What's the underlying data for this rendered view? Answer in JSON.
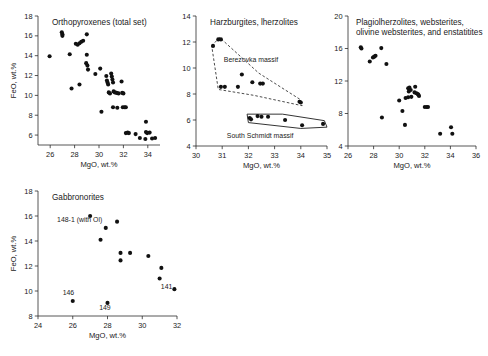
{
  "figure": {
    "background": "#ffffff",
    "marker_color": "#111111",
    "axis_color": "#2b2b2b"
  },
  "chart_data": [
    {
      "type": "scatter",
      "id": "orthopyroxenes",
      "title": "Orthopyroxenes (total set)",
      "xlabel": "MgO, wt.%",
      "ylabel": "FeO, wt.%",
      "xlim": [
        25,
        35
      ],
      "ylim": [
        5,
        18
      ],
      "xticks": [
        26,
        28,
        30,
        32,
        34,
        36
      ],
      "yticks": [
        6,
        8,
        10,
        12,
        14,
        16,
        18
      ],
      "grid": false,
      "legend": "none",
      "points": [
        [
          25.95,
          13.95
        ],
        [
          26.95,
          16.35
        ],
        [
          27.0,
          16.15
        ],
        [
          27.0,
          16.0
        ],
        [
          27.6,
          14.15
        ],
        [
          27.75,
          10.7
        ],
        [
          28.1,
          15.2
        ],
        [
          28.25,
          15.1
        ],
        [
          28.4,
          15.25
        ],
        [
          28.55,
          15.4
        ],
        [
          28.7,
          15.5
        ],
        [
          28.4,
          11.1
        ],
        [
          29.0,
          16.15
        ],
        [
          29.0,
          14.1
        ],
        [
          28.95,
          13.25
        ],
        [
          29.05,
          13.0
        ],
        [
          29.1,
          12.6
        ],
        [
          29.7,
          12.15
        ],
        [
          30.1,
          12.7
        ],
        [
          30.2,
          8.35
        ],
        [
          30.6,
          11.95
        ],
        [
          30.65,
          11.5
        ],
        [
          30.7,
          11.3
        ],
        [
          30.75,
          11.1
        ],
        [
          30.8,
          10.3
        ],
        [
          30.9,
          10.2
        ],
        [
          31.0,
          12.2
        ],
        [
          31.05,
          11.9
        ],
        [
          31.1,
          11.6
        ],
        [
          31.15,
          11.3
        ],
        [
          31.2,
          10.4
        ],
        [
          31.3,
          10.3
        ],
        [
          31.45,
          10.25
        ],
        [
          31.6,
          10.2
        ],
        [
          31.15,
          8.8
        ],
        [
          31.5,
          8.75
        ],
        [
          31.85,
          11.4
        ],
        [
          31.9,
          10.25
        ],
        [
          32.0,
          10.2
        ],
        [
          31.95,
          8.8
        ],
        [
          32.1,
          8.8
        ],
        [
          32.2,
          8.8
        ],
        [
          32.2,
          6.2
        ],
        [
          32.35,
          6.25
        ],
        [
          32.45,
          6.2
        ],
        [
          33.0,
          6.1
        ],
        [
          33.35,
          5.7
        ],
        [
          33.85,
          7.35
        ],
        [
          33.85,
          6.3
        ],
        [
          33.95,
          6.2
        ],
        [
          33.8,
          5.6
        ],
        [
          34.15,
          6.25
        ],
        [
          34.35,
          5.65
        ],
        [
          34.6,
          5.7
        ]
      ]
    },
    {
      "type": "scatter",
      "id": "harzburgites-lherzolites",
      "title": "Harzburgites, lherzolites",
      "xlabel": "MgO, wt.%",
      "ylabel": "",
      "xlim": [
        30,
        35
      ],
      "ylim": [
        4,
        14
      ],
      "xticks": [
        30,
        31,
        32,
        33,
        34,
        35
      ],
      "yticks": [
        4,
        6,
        8,
        10,
        12,
        14
      ],
      "grid": false,
      "legend": "none",
      "points": [
        [
          30.65,
          11.7
        ],
        [
          30.85,
          12.2
        ],
        [
          30.95,
          12.2
        ],
        [
          30.95,
          8.55
        ],
        [
          31.1,
          8.55
        ],
        [
          31.6,
          8.55
        ],
        [
          31.75,
          9.5
        ],
        [
          32.15,
          8.9
        ],
        [
          32.45,
          8.8
        ],
        [
          32.55,
          8.8
        ],
        [
          33.95,
          7.4
        ],
        [
          34.0,
          7.35
        ],
        [
          32.05,
          6.15
        ],
        [
          32.1,
          6.05
        ],
        [
          32.35,
          6.3
        ],
        [
          32.5,
          6.25
        ],
        [
          32.75,
          6.25
        ],
        [
          33.4,
          6.0
        ],
        [
          34.05,
          5.6
        ],
        [
          34.85,
          5.7
        ]
      ],
      "annotations": [
        {
          "text": "Berezovka massif",
          "x": 32.1,
          "y": 10.5,
          "style": "plain"
        },
        {
          "text": "South Schmidt massif",
          "x": 32.45,
          "y": 4.6,
          "style": "plain"
        }
      ],
      "regions": [
        {
          "name": "Berezovka massif",
          "style": "dashed",
          "vertices": [
            [
              30.6,
              11.7
            ],
            [
              30.9,
              12.35
            ],
            [
              32.4,
              9.6
            ],
            [
              34.0,
              7.55
            ],
            [
              34.05,
              7.1
            ],
            [
              32.2,
              7.9
            ],
            [
              30.85,
              8.35
            ],
            [
              30.6,
              11.7
            ]
          ]
        },
        {
          "name": "South Schmidt massif",
          "style": "solid",
          "vertices": [
            [
              31.95,
              6.45
            ],
            [
              33.3,
              6.45
            ],
            [
              34.9,
              5.95
            ],
            [
              35.0,
              5.45
            ],
            [
              34.0,
              5.35
            ],
            [
              32.0,
              5.8
            ],
            [
              31.95,
              6.45
            ]
          ]
        }
      ]
    },
    {
      "type": "scatter",
      "id": "plagiolherzolites-websterites",
      "title_line1": "Plagiolherzolites, websterites,",
      "title_line2": "olivine websterites, and enstatitites",
      "xlabel": "MgO, wt.%",
      "ylabel": "",
      "xlim": [
        26,
        36
      ],
      "ylim": [
        4,
        20
      ],
      "xticks": [
        26,
        28,
        30,
        32,
        34,
        36
      ],
      "yticks": [
        4,
        8,
        12,
        16,
        20
      ],
      "grid": false,
      "legend": "none",
      "points": [
        [
          27.0,
          16.15
        ],
        [
          27.05,
          16.0
        ],
        [
          27.7,
          14.4
        ],
        [
          27.95,
          14.9
        ],
        [
          28.05,
          15.0
        ],
        [
          28.15,
          15.1
        ],
        [
          28.6,
          16.05
        ],
        [
          29.0,
          14.1
        ],
        [
          28.65,
          7.5
        ],
        [
          30.0,
          9.6
        ],
        [
          30.25,
          8.3
        ],
        [
          30.7,
          11.1
        ],
        [
          30.8,
          11.2
        ],
        [
          30.75,
          10.7
        ],
        [
          30.9,
          10.9
        ],
        [
          30.7,
          10.0
        ],
        [
          30.95,
          10.05
        ],
        [
          31.25,
          11.3
        ],
        [
          31.2,
          10.6
        ],
        [
          31.35,
          10.5
        ],
        [
          31.45,
          10.4
        ],
        [
          31.5,
          10.3
        ],
        [
          31.55,
          10.15
        ],
        [
          30.5,
          9.9
        ],
        [
          30.45,
          6.6
        ],
        [
          32.0,
          8.8
        ],
        [
          32.15,
          8.8
        ],
        [
          32.25,
          8.8
        ],
        [
          33.2,
          5.5
        ],
        [
          34.05,
          6.3
        ],
        [
          34.15,
          5.5
        ]
      ]
    },
    {
      "type": "scatter",
      "id": "gabbronorites",
      "title": "Gabbronorites",
      "xlabel": "MgO, wt.%",
      "ylabel": "FeO, wt.%",
      "xlim": [
        24,
        32
      ],
      "ylim": [
        8,
        18
      ],
      "xticks": [
        24,
        26,
        28,
        30,
        32
      ],
      "yticks": [
        8,
        10,
        12,
        14,
        16,
        18
      ],
      "grid": false,
      "legend": "none",
      "points": [
        [
          27.0,
          16.0
        ],
        [
          27.9,
          15.05
        ],
        [
          28.55,
          15.55
        ],
        [
          27.6,
          14.1
        ],
        [
          28.75,
          13.05
        ],
        [
          29.3,
          13.05
        ],
        [
          28.75,
          12.45
        ],
        [
          30.35,
          12.8
        ],
        [
          31.1,
          11.85
        ],
        [
          31.0,
          11.0
        ],
        [
          31.85,
          10.15
        ],
        [
          26.0,
          9.2
        ],
        [
          28.0,
          9.05
        ]
      ],
      "annotations": [
        {
          "text": "148-1 (with Ol)",
          "x": 26.4,
          "y": 15.55,
          "style": "plain"
        },
        {
          "text": "146",
          "x": 25.75,
          "y": 9.65,
          "style": "plain"
        },
        {
          "text": "149",
          "x": 27.85,
          "y": 8.5,
          "style": "plain"
        },
        {
          "text": "141",
          "x": 31.4,
          "y": 10.15,
          "style": "plain"
        }
      ]
    }
  ]
}
